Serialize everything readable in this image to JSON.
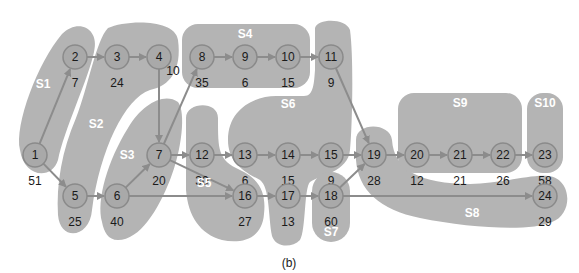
{
  "caption": "(b)",
  "colors": {
    "region": "#b4b4b4",
    "node_fill": "#a9a9a9",
    "node_stroke": "#8a8a8a",
    "edge": "#8c8c8c",
    "group_label": "#ffffff",
    "text": "#1a1a1a"
  },
  "nodes": [
    {
      "id": "1",
      "weight": "51",
      "x": 35,
      "y": 155
    },
    {
      "id": "2",
      "weight": "7",
      "x": 75,
      "y": 57
    },
    {
      "id": "3",
      "weight": "24",
      "x": 117,
      "y": 57
    },
    {
      "id": "4",
      "weight": "10",
      "x": 159,
      "y": 57
    },
    {
      "id": "5",
      "weight": "25",
      "x": 75,
      "y": 196
    },
    {
      "id": "6",
      "weight": "40",
      "x": 117,
      "y": 196
    },
    {
      "id": "7",
      "weight": "20",
      "x": 159,
      "y": 155
    },
    {
      "id": "8",
      "weight": "35",
      "x": 202,
      "y": 57
    },
    {
      "id": "9",
      "weight": "6",
      "x": 245,
      "y": 57
    },
    {
      "id": "10",
      "weight": "15",
      "x": 288,
      "y": 57
    },
    {
      "id": "11",
      "weight": "9",
      "x": 331,
      "y": 57
    },
    {
      "id": "12",
      "weight": "30",
      "x": 202,
      "y": 155
    },
    {
      "id": "13",
      "weight": "6",
      "x": 245,
      "y": 155
    },
    {
      "id": "14",
      "weight": "15",
      "x": 288,
      "y": 155
    },
    {
      "id": "15",
      "weight": "9",
      "x": 331,
      "y": 155
    },
    {
      "id": "16",
      "weight": "27",
      "x": 245,
      "y": 196
    },
    {
      "id": "17",
      "weight": "13",
      "x": 288,
      "y": 196
    },
    {
      "id": "18",
      "weight": "60",
      "x": 331,
      "y": 196
    },
    {
      "id": "19",
      "weight": "28",
      "x": 374,
      "y": 155
    },
    {
      "id": "20",
      "weight": "12",
      "x": 417,
      "y": 155
    },
    {
      "id": "21",
      "weight": "21",
      "x": 460,
      "y": 155
    },
    {
      "id": "22",
      "weight": "26",
      "x": 503,
      "y": 155
    },
    {
      "id": "23",
      "weight": "58",
      "x": 545,
      "y": 155
    },
    {
      "id": "24",
      "weight": "29",
      "x": 545,
      "y": 196
    }
  ],
  "edges": [
    [
      "1",
      "2"
    ],
    [
      "1",
      "5"
    ],
    [
      "2",
      "3"
    ],
    [
      "3",
      "4"
    ],
    [
      "4",
      "7"
    ],
    [
      "5",
      "6"
    ],
    [
      "6",
      "7"
    ],
    [
      "6",
      "16"
    ],
    [
      "7",
      "8"
    ],
    [
      "7",
      "12"
    ],
    [
      "7",
      "16"
    ],
    [
      "8",
      "9"
    ],
    [
      "9",
      "10"
    ],
    [
      "10",
      "11"
    ],
    [
      "11",
      "19"
    ],
    [
      "12",
      "13"
    ],
    [
      "13",
      "14"
    ],
    [
      "14",
      "15"
    ],
    [
      "15",
      "19"
    ],
    [
      "16",
      "17"
    ],
    [
      "17",
      "18"
    ],
    [
      "18",
      "19"
    ],
    [
      "18",
      "24"
    ],
    [
      "19",
      "20"
    ],
    [
      "20",
      "21"
    ],
    [
      "21",
      "22"
    ],
    [
      "22",
      "23"
    ]
  ],
  "groups": [
    {
      "id": "S1",
      "label": "S1",
      "lx": 43,
      "ly": 84
    },
    {
      "id": "S2",
      "label": "S2",
      "lx": 96,
      "ly": 124
    },
    {
      "id": "S3",
      "label": "S3",
      "lx": 127,
      "ly": 155
    },
    {
      "id": "S4",
      "label": "S4",
      "lx": 245,
      "ly": 34
    },
    {
      "id": "S5",
      "label": "S5",
      "lx": 204,
      "ly": 183
    },
    {
      "id": "S6",
      "label": "S6",
      "lx": 288,
      "ly": 104
    },
    {
      "id": "S7",
      "label": "S7",
      "lx": 331,
      "ly": 232
    },
    {
      "id": "S8",
      "label": "S8",
      "lx": 472,
      "ly": 213
    },
    {
      "id": "S9",
      "label": "S9",
      "lx": 460,
      "ly": 103
    },
    {
      "id": "S10",
      "label": "S10",
      "lx": 545,
      "ly": 103
    }
  ]
}
